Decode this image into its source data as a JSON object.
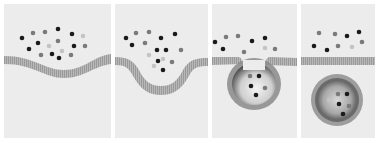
{
  "figure": {
    "background": "#ececec",
    "membrane_color": "#a8a8a8",
    "particle_colors": {
      "dark": "#1a1a1a",
      "mid": "#7a7a7a",
      "light": "#c4c4c4"
    },
    "panels": [
      {
        "id": "stage-1",
        "label": "Membrane with extracellular particles",
        "x": 4,
        "width": 107
      },
      {
        "id": "stage-2",
        "label": "Membrane invagination",
        "x": 115,
        "width": 93
      },
      {
        "id": "stage-3",
        "label": "Vesicle pinching off",
        "x": 212,
        "width": 85
      },
      {
        "id": "stage-4",
        "label": "Free endocytic vesicle",
        "x": 301,
        "width": 74
      }
    ]
  }
}
